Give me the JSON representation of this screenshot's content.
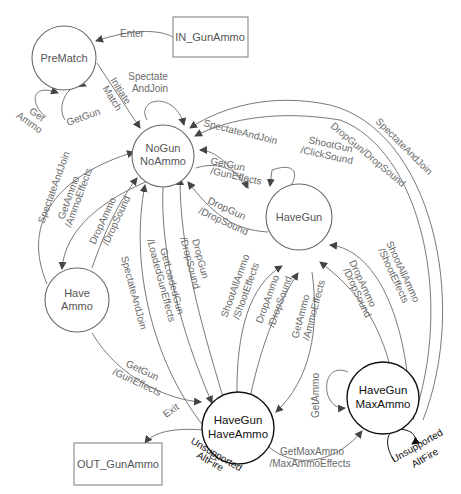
{
  "diagram": {
    "type": "state-machine",
    "nodes": {
      "in_box": "IN_GunAmmo",
      "out_box": "OUT_GunAmmo",
      "prematch": "PreMatch",
      "nogun_1": "NoGun",
      "nogun_2": "NoAmmo",
      "havegun": "HaveGun",
      "haveammo_1": "Have",
      "haveammo_2": "Ammo",
      "hgha_1": "HaveGun",
      "hgha_2": "HaveAmmo",
      "hgma_1": "HaveGun",
      "hgma_2": "MaxAmmo"
    },
    "edges": {
      "enter": "Enter",
      "initiate_1": "Initiate",
      "initiate_2": "Match",
      "get_ammo_1": "Get",
      "get_ammo_2": "Ammo",
      "getgun_prematch": "GetGun",
      "spectate_self_1": "Spectate",
      "spectate_self_2": "AndJoin",
      "spectate_havegun": "SpectateAndJoin",
      "getgun_nogun_1": "GetGun",
      "getgun_nogun_2": "/GunEffects",
      "shootgun_1": "ShootGun",
      "shootgun_2": "/ClickSound",
      "dropgun_hg_1": "DropGun",
      "dropgun_hg_2": "/DropSound",
      "dropgun_dropsound_outer": "DropGun/DropSound",
      "spectate_outer": "SpectateAndJoin",
      "spectate_haveammo": "SpectateAndJoin",
      "getammo_nogun_1": "GetAmmo",
      "getammo_nogun_2": "/AmmoEffects",
      "dropammo_ha_1": "DropAmmo",
      "dropammo_ha_2": "/DropSound",
      "spectate_hgha": "SpectateAndJoin",
      "getloadedgun_1": "GetLoadedGun",
      "getloadedgun_2": "/LoadedGunEffects",
      "dropgun_hgha_1": "DropGun",
      "dropgun_hgha_2": "/DropSound",
      "shootall_hgha_1": "ShootAllAmmo",
      "shootall_hgha_2": "/ShootEffects",
      "dropammo_hgha_1": "DropAmmo",
      "dropammo_hgha_2": "/DropSound",
      "getammo_hg_1": "GetAmmo",
      "getammo_hg_2": "/AmmoEffects",
      "dropammo_hgma_1": "DropAmmo",
      "dropammo_hgma_2": "/DropSound",
      "shootall_hgma_1": "ShootAllAmmo",
      "shootall_hgma_2": "/ShootEffects",
      "getgun_ha_1": "GetGun",
      "getgun_ha_2": "/GunEffects",
      "exit": "Exit",
      "unsupported_1": "Unsupported",
      "unsupported_2": "AltFire",
      "getmaxammo_1": "GetMaxAmmo",
      "getmaxammo_2": "/MaxAmmoEffects",
      "getammo_self": "GetAmmo",
      "unsupported_ma_1": "Unsupported",
      "unsupported_ma_2": "AltFire"
    }
  }
}
